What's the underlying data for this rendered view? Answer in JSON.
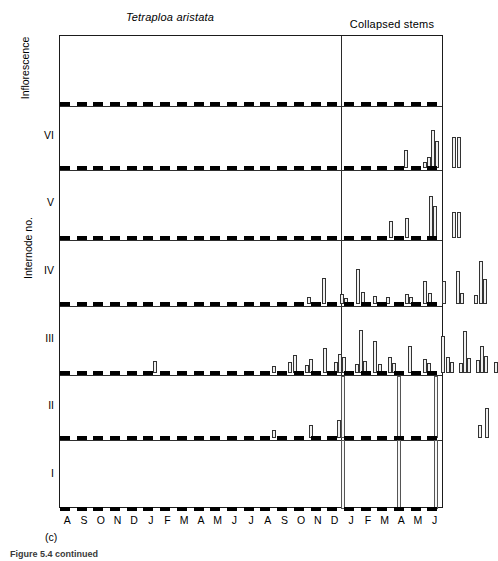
{
  "figure": {
    "species_title": "Tetraploa aristata",
    "collapsed_title": "Collapsed stems",
    "y_axis_label": "Internode no.",
    "panel_letter": "(c)",
    "caption": "Figure 5.4 continued"
  },
  "x_axis": {
    "months": [
      "A",
      "S",
      "O",
      "N",
      "D",
      "J",
      "F",
      "M",
      "A",
      "M",
      "J",
      "J",
      "A",
      "S",
      "O",
      "N",
      "D",
      "J",
      "F",
      "M",
      "A",
      "M",
      "J"
    ]
  },
  "panels": [
    {
      "id": "inflorescence",
      "label": "Inflorescence"
    },
    {
      "id": "vi",
      "label": "VI"
    },
    {
      "id": "v",
      "label": "V"
    },
    {
      "id": "iv",
      "label": "IV"
    },
    {
      "id": "iii",
      "label": "III"
    },
    {
      "id": "ii",
      "label": "II"
    },
    {
      "id": "i",
      "label": "I"
    }
  ],
  "chart_data": {
    "type": "bar",
    "title": "Tetraploa aristata",
    "subtitle": "Collapsed stems",
    "xlabel": "",
    "ylabel": "Internode no.",
    "grid": false,
    "legend": "none",
    "x_categories": [
      "A",
      "S",
      "O",
      "N",
      "D",
      "J",
      "F",
      "M",
      "A",
      "M",
      "J",
      "J",
      "A",
      "S",
      "O",
      "N",
      "D",
      "J",
      "F",
      "M",
      "A",
      "M",
      "J"
    ],
    "collapsed_stems_start_index": 17,
    "panel_order": [
      "Inflorescence",
      "VI",
      "V",
      "IV",
      "III",
      "II",
      "I"
    ],
    "ylim": [
      0,
      100
    ],
    "note": "Each panel baseline is a dashed rule; bar values are percentage occurrence per sampling month, several narrow bars may share one month slot.",
    "series": [
      {
        "name": "Inflorescence",
        "panel_height_px": 64,
        "bars": []
      },
      {
        "name": "VI",
        "panel_height_px": 64,
        "bars": [
          {
            "x_px": 344,
            "w_px": 4,
            "h_px": 18
          },
          {
            "x_px": 363,
            "w_px": 4,
            "h_px": 6
          },
          {
            "x_px": 367,
            "w_px": 4,
            "h_px": 11
          },
          {
            "x_px": 371,
            "w_px": 4,
            "h_px": 38
          },
          {
            "x_px": 375,
            "w_px": 4,
            "h_px": 27
          },
          {
            "x_px": 392,
            "w_px": 4,
            "h_px": 31
          },
          {
            "x_px": 397,
            "w_px": 4,
            "h_px": 31
          }
        ]
      },
      {
        "name": "V",
        "panel_height_px": 70,
        "bars": [
          {
            "x_px": 329,
            "w_px": 4,
            "h_px": 17
          },
          {
            "x_px": 345,
            "w_px": 4,
            "h_px": 20
          },
          {
            "x_px": 369,
            "w_px": 4,
            "h_px": 42
          },
          {
            "x_px": 373,
            "w_px": 4,
            "h_px": 32
          },
          {
            "x_px": 392,
            "w_px": 4,
            "h_px": 26
          },
          {
            "x_px": 397,
            "w_px": 4,
            "h_px": 26
          }
        ]
      },
      {
        "name": "IV",
        "panel_height_px": 66,
        "bars": [
          {
            "x_px": 247,
            "w_px": 4,
            "h_px": 7
          },
          {
            "x_px": 262,
            "w_px": 4,
            "h_px": 26
          },
          {
            "x_px": 280,
            "w_px": 4,
            "h_px": 10
          },
          {
            "x_px": 284,
            "w_px": 4,
            "h_px": 6
          },
          {
            "x_px": 296,
            "w_px": 4,
            "h_px": 35
          },
          {
            "x_px": 301,
            "w_px": 4,
            "h_px": 12
          },
          {
            "x_px": 313,
            "w_px": 4,
            "h_px": 8
          },
          {
            "x_px": 326,
            "w_px": 4,
            "h_px": 7
          },
          {
            "x_px": 345,
            "w_px": 4,
            "h_px": 10
          },
          {
            "x_px": 349,
            "w_px": 4,
            "h_px": 7
          },
          {
            "x_px": 363,
            "w_px": 4,
            "h_px": 23
          },
          {
            "x_px": 368,
            "w_px": 4,
            "h_px": 11
          },
          {
            "x_px": 382,
            "w_px": 4,
            "h_px": 23
          },
          {
            "x_px": 396,
            "w_px": 4,
            "h_px": 33
          },
          {
            "x_px": 400,
            "w_px": 4,
            "h_px": 11
          },
          {
            "x_px": 414,
            "w_px": 4,
            "h_px": 9
          },
          {
            "x_px": 419,
            "w_px": 4,
            "h_px": 43
          },
          {
            "x_px": 423,
            "w_px": 4,
            "h_px": 25
          }
        ]
      },
      {
        "name": "III",
        "panel_height_px": 65,
        "bars": [
          {
            "x_px": 93,
            "w_px": 4,
            "h_px": 12
          },
          {
            "x_px": 212,
            "w_px": 4,
            "h_px": 7
          },
          {
            "x_px": 228,
            "w_px": 4,
            "h_px": 11
          },
          {
            "x_px": 233,
            "w_px": 4,
            "h_px": 18
          },
          {
            "x_px": 245,
            "w_px": 4,
            "h_px": 8
          },
          {
            "x_px": 249,
            "w_px": 4,
            "h_px": 14
          },
          {
            "x_px": 263,
            "w_px": 4,
            "h_px": 25
          },
          {
            "x_px": 274,
            "w_px": 4,
            "h_px": 11
          },
          {
            "x_px": 278,
            "w_px": 4,
            "h_px": 19
          },
          {
            "x_px": 282,
            "w_px": 4,
            "h_px": 16
          },
          {
            "x_px": 295,
            "w_px": 4,
            "h_px": 9
          },
          {
            "x_px": 299,
            "w_px": 4,
            "h_px": 43
          },
          {
            "x_px": 303,
            "w_px": 4,
            "h_px": 12
          },
          {
            "x_px": 313,
            "w_px": 4,
            "h_px": 32
          },
          {
            "x_px": 318,
            "w_px": 4,
            "h_px": 9
          },
          {
            "x_px": 328,
            "w_px": 4,
            "h_px": 16
          },
          {
            "x_px": 332,
            "w_px": 4,
            "h_px": 10
          },
          {
            "x_px": 348,
            "w_px": 4,
            "h_px": 27
          },
          {
            "x_px": 363,
            "w_px": 4,
            "h_px": 14
          },
          {
            "x_px": 367,
            "w_px": 4,
            "h_px": 10
          },
          {
            "x_px": 381,
            "w_px": 4,
            "h_px": 37
          },
          {
            "x_px": 386,
            "w_px": 4,
            "h_px": 16
          },
          {
            "x_px": 390,
            "w_px": 4,
            "h_px": 11
          },
          {
            "x_px": 399,
            "w_px": 4,
            "h_px": 10
          },
          {
            "x_px": 403,
            "w_px": 4,
            "h_px": 42
          },
          {
            "x_px": 407,
            "w_px": 4,
            "h_px": 15
          },
          {
            "x_px": 416,
            "w_px": 4,
            "h_px": 13
          },
          {
            "x_px": 420,
            "w_px": 4,
            "h_px": 27
          },
          {
            "x_px": 424,
            "w_px": 4,
            "h_px": 17
          },
          {
            "x_px": 434,
            "w_px": 4,
            "h_px": 11
          }
        ]
      },
      {
        "name": "II",
        "panel_height_px": 65,
        "bars": [
          {
            "x_px": 212,
            "w_px": 4,
            "h_px": 8
          },
          {
            "x_px": 249,
            "w_px": 4,
            "h_px": 13
          },
          {
            "x_px": 277,
            "w_px": 4,
            "h_px": 18
          },
          {
            "x_px": 281,
            "w_px": 4,
            "h_px": 62,
            "tall": true
          },
          {
            "x_px": 337,
            "w_px": 4,
            "h_px": 62,
            "tall": true
          },
          {
            "x_px": 374,
            "w_px": 4,
            "h_px": 62,
            "tall": true
          },
          {
            "x_px": 418,
            "w_px": 4,
            "h_px": 13
          },
          {
            "x_px": 425,
            "w_px": 4,
            "h_px": 30
          }
        ]
      },
      {
        "name": "I",
        "panel_height_px": 71,
        "bars": [
          {
            "x_px": 281,
            "w_px": 4,
            "h_px": 69,
            "tall": true
          },
          {
            "x_px": 337,
            "w_px": 4,
            "h_px": 69,
            "tall": true
          },
          {
            "x_px": 374,
            "w_px": 4,
            "h_px": 69,
            "tall": true
          }
        ]
      }
    ]
  },
  "layout": {
    "plot_left_px": 59,
    "plot_top_px": 35,
    "plot_width_px": 384,
    "plot_height_px": 473,
    "collapsed_divider_x_px": 281,
    "panel_baselines_y_px": [
      68,
      132,
      202,
      268,
      337,
      402,
      473
    ]
  }
}
